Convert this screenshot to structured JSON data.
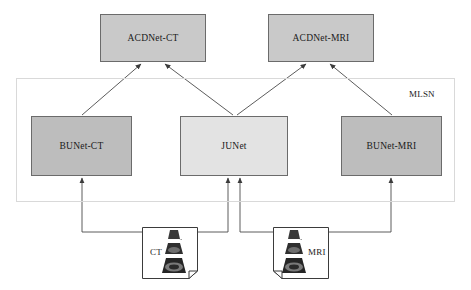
{
  "diagram": {
    "group": {
      "label": "MLSN"
    },
    "nodes": [
      {
        "id": "acdnet-ct",
        "label": "ACDNet-CT",
        "x": 100,
        "y": 14,
        "w": 106,
        "h": 48,
        "style": "node-acd"
      },
      {
        "id": "acdnet-mri",
        "label": "ACDNet-MRI",
        "x": 268,
        "y": 14,
        "w": 106,
        "h": 48,
        "style": "node-acd"
      },
      {
        "id": "bunet-ct",
        "label": "BUNet-CT",
        "x": 31,
        "y": 116,
        "w": 101,
        "h": 60,
        "style": "node-bunet"
      },
      {
        "id": "junet",
        "label": "JUNet",
        "x": 180,
        "y": 116,
        "w": 108,
        "h": 60,
        "style": "node-junet"
      },
      {
        "id": "bunet-mri",
        "label": "BUNet-MRI",
        "x": 341,
        "y": 116,
        "w": 101,
        "h": 60,
        "style": "node-bunet"
      }
    ],
    "documents": [
      {
        "id": "ct-doc",
        "label": "CT",
        "x": 142,
        "y": 227,
        "w": 56,
        "h": 52,
        "fold": "bottom-right",
        "label_side": "left",
        "fan_side": "right"
      },
      {
        "id": "mri-doc",
        "label": "MRI",
        "x": 273,
        "y": 227,
        "w": 56,
        "h": 52,
        "fold": "bottom-left",
        "label_side": "right",
        "fan_side": "left"
      }
    ],
    "edges": [
      {
        "from": "bunet-ct",
        "to": "acdnet-ct",
        "kind": "diagonal-arrow"
      },
      {
        "from": "junet",
        "to": "acdnet-ct",
        "kind": "diagonal-arrow"
      },
      {
        "from": "junet",
        "to": "acdnet-mri",
        "kind": "diagonal-arrow"
      },
      {
        "from": "bunet-mri",
        "to": "acdnet-mri",
        "kind": "diagonal-arrow"
      },
      {
        "from": "ct-doc",
        "to": "bunet-ct",
        "kind": "orthogonal-arrow"
      },
      {
        "from": "ct-doc",
        "to": "junet",
        "kind": "orthogonal-arrow"
      },
      {
        "from": "mri-doc",
        "to": "junet",
        "kind": "orthogonal-arrow"
      },
      {
        "from": "mri-doc",
        "to": "bunet-mri",
        "kind": "orthogonal-arrow"
      }
    ],
    "colors": {
      "acdnet_fill": "#c9c9c9",
      "bunet_fill": "#bdbdbd",
      "junet_fill": "#e3e3e3",
      "node_border": "#6b6b6b",
      "group_border": "#d9d9d9",
      "edge": "#4a4a4a",
      "background": "#ffffff"
    }
  }
}
